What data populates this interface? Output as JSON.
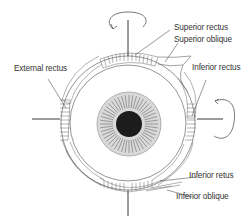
{
  "diagram": {
    "type": "anatomical-illustration",
    "colors": {
      "line": "#555555",
      "axis": "#3a3a3a",
      "iris": "#d9d9d9",
      "iris_stripes": "#7a7a7a",
      "pupil": "#1c1c1c",
      "text": "#333333",
      "background": "#ffffff"
    },
    "labels": {
      "superior_rectus": "Superior rectus",
      "superior_oblique": "Superior oblique",
      "external_rectus": "External rectus",
      "inferior_rectus_upper": "Inferior rectus",
      "inferior_retus": "Inferior retus",
      "inferior_oblique": "Inferior oblique"
    },
    "icons": {
      "top_rotation": "rotation-arrow-icon",
      "right_rotation": "rotation-arrow-icon"
    }
  }
}
